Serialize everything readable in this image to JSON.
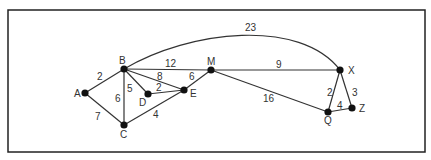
{
  "diagram": {
    "type": "weighted-graph",
    "frame": {
      "x": 8,
      "y": 10,
      "w": 417,
      "h": 142
    },
    "nodes": [
      {
        "id": "A",
        "label": "A",
        "x": 85,
        "y": 93,
        "lx": 74,
        "ly": 97
      },
      {
        "id": "B",
        "label": "B",
        "x": 124,
        "y": 69,
        "lx": 119,
        "ly": 64
      },
      {
        "id": "C",
        "label": "C",
        "x": 124,
        "y": 125,
        "lx": 120,
        "ly": 138
      },
      {
        "id": "D",
        "label": "D",
        "x": 148,
        "y": 94,
        "lx": 139,
        "ly": 106
      },
      {
        "id": "E",
        "label": "E",
        "x": 184,
        "y": 90,
        "lx": 190,
        "ly": 97
      },
      {
        "id": "M",
        "label": "M",
        "x": 211,
        "y": 70,
        "lx": 207,
        "ly": 65
      },
      {
        "id": "X",
        "label": "X",
        "x": 340,
        "y": 70,
        "lx": 348,
        "ly": 74
      },
      {
        "id": "Q",
        "label": "Q",
        "x": 328,
        "y": 112,
        "lx": 324,
        "ly": 124
      },
      {
        "id": "Z",
        "label": "Z",
        "x": 352,
        "y": 108,
        "lx": 359,
        "ly": 112
      }
    ],
    "edges": [
      {
        "from": "A",
        "to": "B",
        "weight": "2",
        "lx": 97,
        "ly": 80
      },
      {
        "from": "A",
        "to": "C",
        "weight": "7",
        "lx": 95,
        "ly": 120
      },
      {
        "from": "B",
        "to": "C",
        "weight": "6",
        "lx": 115,
        "ly": 102
      },
      {
        "from": "B",
        "to": "D",
        "weight": "5",
        "lx": 127,
        "ly": 92
      },
      {
        "from": "B",
        "to": "E",
        "weight": "8",
        "lx": 157,
        "ly": 80
      },
      {
        "from": "B",
        "to": "M",
        "weight": "12",
        "lx": 165,
        "ly": 67
      },
      {
        "from": "D",
        "to": "E",
        "weight": "2",
        "lx": 156,
        "ly": 91
      },
      {
        "from": "C",
        "to": "E",
        "weight": "4",
        "lx": 153,
        "ly": 118
      },
      {
        "from": "E",
        "to": "M",
        "weight": "6",
        "lx": 189,
        "ly": 80
      },
      {
        "from": "M",
        "to": "X",
        "weight": "9",
        "lx": 276,
        "ly": 68
      },
      {
        "from": "M",
        "to": "Q",
        "weight": "16",
        "lx": 263,
        "ly": 102
      },
      {
        "from": "X",
        "to": "Q",
        "weight": "2",
        "lx": 327,
        "ly": 96
      },
      {
        "from": "X",
        "to": "Z",
        "weight": "3",
        "lx": 352,
        "ly": 96
      },
      {
        "from": "Q",
        "to": "Z",
        "weight": "4",
        "lx": 337,
        "ly": 109
      },
      {
        "from": "B",
        "to": "X",
        "weight": "23",
        "curved": true,
        "cx1": 190,
        "cy1": 30,
        "cx2": 300,
        "cy2": 18,
        "lx": 245,
        "ly": 31
      }
    ]
  }
}
